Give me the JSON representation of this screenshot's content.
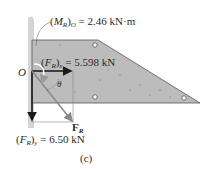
{
  "figure": {
    "caption": "(c)",
    "origin_label": "O",
    "angle_label": "θ",
    "moment": {
      "symbol": "M",
      "subscript": "R",
      "outer_subscript": "O",
      "value": "= 2.46 kN·m"
    },
    "force_x": {
      "symbol": "F",
      "subscript": "R",
      "outer_subscript": "x",
      "value": "= 5.598 kN"
    },
    "force_y": {
      "symbol": "F",
      "subscript": "R",
      "outer_subscript": "y",
      "value": "= 6.50 kN"
    },
    "resultant": {
      "symbol": "F",
      "subscript": "R"
    }
  },
  "colors": {
    "slab": "#bdbdbd",
    "wall": "#cfcfcf",
    "arrow": "#1a1a1a",
    "resultant_arrow": "#8a8a8a",
    "moment_arrow": "#ffffff"
  }
}
